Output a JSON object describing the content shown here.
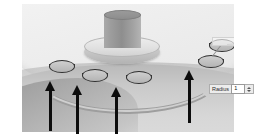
{
  "app": {
    "kind": "cad-3d-viewport",
    "view_label": "isometric"
  },
  "scene": {
    "name": "curved-rail-hole-pattern",
    "part": {
      "top_face": "cylindrical-plateau",
      "front_wall": "curved-front-wall",
      "boss": "central-cylindrical-boss"
    },
    "rail": {
      "name": "curved-slot-path",
      "color": "#9e9e9e"
    },
    "handles": [
      {
        "id": "hole-1",
        "x": 27,
        "y": 62
      },
      {
        "id": "hole-2",
        "x": 60,
        "y": 71
      },
      {
        "id": "hole-3",
        "x": 104,
        "y": 73
      },
      {
        "id": "hole-4",
        "x": 176,
        "y": 57
      },
      {
        "id": "hole-5",
        "x": 187,
        "y": 41
      }
    ],
    "arrows": [
      {
        "id": "arrow-1",
        "x": 45,
        "y": 81,
        "length": 43
      },
      {
        "id": "arrow-2",
        "x": 72,
        "y": 85,
        "length": 42
      },
      {
        "id": "arrow-3",
        "x": 111,
        "y": 87,
        "length": 44
      },
      {
        "id": "arrow-4",
        "x": 184,
        "y": 70,
        "length": 46
      }
    ]
  },
  "callouts": {
    "radius": {
      "label": "Radius",
      "value": "1",
      "x": 209,
      "y": 84
    },
    "upper": {
      "label": "",
      "value": "",
      "x": 214,
      "y": 42
    }
  },
  "colors": {
    "background": "#ffffff",
    "surface_light": "#f2f2f2",
    "surface_mid": "#c9c9c9",
    "surface_dark": "#9b9b9b",
    "outline": "#2f2f2f",
    "annotation": "#0d0d0d"
  }
}
